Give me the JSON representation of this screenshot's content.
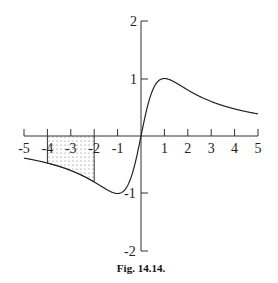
{
  "chart_data": {
    "type": "line",
    "title": "",
    "caption": "Fig. 14.14.",
    "function": "y = 2x/(1+x^2)",
    "xlabel": "",
    "ylabel": "",
    "xlim": [
      -5,
      5
    ],
    "ylim": [
      -2,
      2
    ],
    "x_ticks": [
      -5,
      -4,
      -3,
      -2,
      -1,
      0,
      1,
      2,
      3,
      4,
      5
    ],
    "x_tick_labels": [
      "-5",
      "-4",
      "-3",
      "-2",
      "-1",
      "1",
      "2",
      "3",
      "4",
      "5"
    ],
    "y_ticks": [
      -2,
      -1,
      1,
      2
    ],
    "y_tick_labels": [
      "2",
      "1",
      "-1",
      "-2"
    ],
    "grid": false,
    "series": [
      {
        "name": "curve",
        "x": [
          -5,
          -4,
          -3,
          -2,
          -1,
          -0.5,
          0,
          0.5,
          1,
          2,
          3,
          4,
          5
        ],
        "values": [
          -0.385,
          -0.471,
          -0.6,
          -0.8,
          -1.0,
          -0.8,
          0,
          0.8,
          1.0,
          0.8,
          0.6,
          0.471,
          0.385
        ]
      }
    ],
    "shaded_region": {
      "x_from": -4,
      "x_to": -2,
      "between": "curve and x-axis",
      "pattern": "dotted"
    }
  },
  "labels": {
    "x": [
      "-5",
      "-4",
      "-3",
      "-2",
      "-1",
      "1",
      "2",
      "3",
      "4",
      "5"
    ],
    "y_top2": "2",
    "y_top1": "1",
    "y_bot1": "-1",
    "y_bot2": "-2"
  },
  "caption": "Fig. 14.14."
}
